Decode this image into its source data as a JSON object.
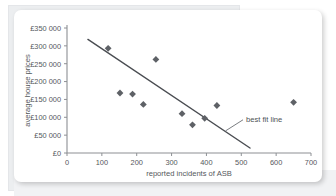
{
  "chart_data": {
    "type": "scatter",
    "title": "",
    "xlabel": "reported incidents of ASB",
    "ylabel": "average house prices",
    "xlim": [
      0,
      700
    ],
    "ylim": [
      0,
      350000
    ],
    "grid": false,
    "legend": "none",
    "x_ticks": [
      0,
      100,
      200,
      300,
      400,
      500,
      600,
      700
    ],
    "x_tick_labels": [
      "0",
      "100",
      "200",
      "300",
      "400",
      "500",
      "600",
      "700"
    ],
    "y_ticks": [
      0,
      50000,
      100000,
      150000,
      200000,
      250000,
      300000,
      350000
    ],
    "y_tick_labels": [
      "£0",
      "£50 000",
      "£100 000",
      "£150 000",
      "£200 000",
      "£250 000",
      "£300 000",
      "£350 000"
    ],
    "points": [
      {
        "x": 118,
        "y": 293000
      },
      {
        "x": 152,
        "y": 168000
      },
      {
        "x": 188,
        "y": 165000
      },
      {
        "x": 219,
        "y": 136000
      },
      {
        "x": 255,
        "y": 262000
      },
      {
        "x": 330,
        "y": 110000
      },
      {
        "x": 360,
        "y": 79000
      },
      {
        "x": 395,
        "y": 97000
      },
      {
        "x": 430,
        "y": 133000
      },
      {
        "x": 650,
        "y": 142000
      }
    ],
    "marker_shape": "diamond",
    "marker_color": "#5e6166",
    "trendline": {
      "label": "best fit line",
      "x_start": 60,
      "y_start": 318000,
      "x_end": 525,
      "y_end": 14000,
      "color": "#4a4d52"
    },
    "annotation": {
      "text": "best fit line",
      "leader_from_x": 455,
      "leader_from_y": 62000,
      "leader_to_x": 505,
      "leader_to_y": 93000
    }
  }
}
